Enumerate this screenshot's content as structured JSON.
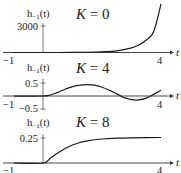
{
  "chart_data": [
    {
      "type": "line",
      "title": "K = 0",
      "param": "K",
      "param_value": "0",
      "xlabel": "t",
      "ylabel": "h_-1(t)",
      "xlim": [
        -1,
        4
      ],
      "x_ticks": [
        "-1",
        "4"
      ],
      "y_ticks": [
        "3000"
      ],
      "ylim": [
        0,
        5600
      ],
      "grid": false,
      "x": [
        -1,
        0,
        0.5,
        1,
        1.5,
        2,
        2.5,
        3,
        3.25,
        3.5,
        3.75,
        4
      ],
      "values": [
        0,
        0,
        2,
        8,
        25,
        70,
        190,
        520,
        860,
        1420,
        2350,
        5500
      ]
    },
    {
      "type": "line",
      "title": "K = 4",
      "param": "K",
      "param_value": "4",
      "xlabel": "t",
      "ylabel": "h_-1(t)",
      "xlim": [
        -1,
        4
      ],
      "x_ticks": [
        "-1",
        "4"
      ],
      "y_ticks": [
        "0.5",
        "-0.5"
      ],
      "ylim": [
        -0.5,
        0.5
      ],
      "grid": false,
      "x": [
        -1,
        0,
        0.25,
        0.5,
        0.75,
        1,
        1.25,
        1.5,
        1.75,
        2,
        2.25,
        2.5,
        2.75,
        3,
        3.25,
        3.5,
        3.75,
        4
      ],
      "values": [
        0,
        0,
        0.04,
        0.14,
        0.26,
        0.36,
        0.42,
        0.44,
        0.42,
        0.34,
        0.22,
        0.08,
        -0.06,
        -0.14,
        -0.15,
        -0.08,
        0.06,
        0.22
      ]
    },
    {
      "type": "line",
      "title": "K = 8",
      "param": "K",
      "param_value": "8",
      "xlabel": "t",
      "ylabel": "h_-1(t)",
      "xlim": [
        -1,
        4
      ],
      "x_ticks": [
        "-1",
        "4"
      ],
      "y_ticks": [
        "0.25"
      ],
      "ylim": [
        0,
        0.3
      ],
      "grid": false,
      "x": [
        -1,
        0,
        0.25,
        0.5,
        0.75,
        1,
        1.25,
        1.5,
        2,
        2.5,
        3,
        3.5,
        4
      ],
      "values": [
        0,
        0,
        0.05,
        0.1,
        0.145,
        0.18,
        0.205,
        0.222,
        0.24,
        0.248,
        0.252,
        0.254,
        0.255
      ]
    }
  ],
  "panels": [
    {
      "title_var": "K",
      "title_eq": " = 0",
      "ylabel_main": "h",
      "ylabel_sub": "−1",
      "ylabel_arg": "(t)",
      "ytick_top": "3000",
      "xtick_left": "−1",
      "xtick_right": "4",
      "xvar": "t"
    },
    {
      "title_var": "K",
      "title_eq": " = 4",
      "ylabel_main": "h",
      "ylabel_sub": "−1",
      "ylabel_arg": "(t)",
      "ytick_top": "0.5",
      "ytick_bottom": "−0.5",
      "xtick_left": "−1",
      "xtick_right": "4",
      "xvar": "t"
    },
    {
      "title_var": "K",
      "title_eq": " = 8",
      "ylabel_main": "h",
      "ylabel_sub": "−1",
      "ylabel_arg": "(t)",
      "ytick_top": "0.25",
      "xtick_left": "−1",
      "xtick_right": "4",
      "xvar": "t"
    }
  ]
}
